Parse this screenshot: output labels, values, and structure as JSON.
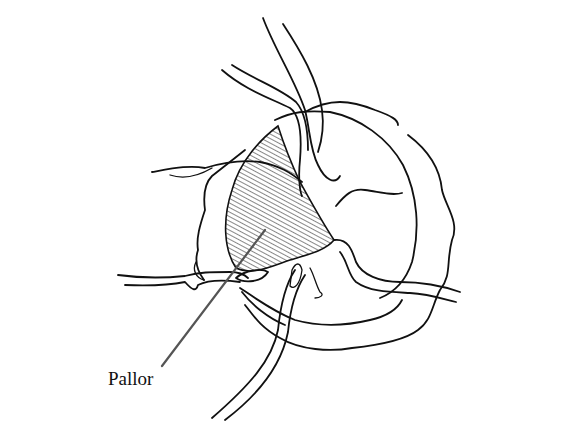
{
  "diagram": {
    "labels": [
      {
        "text": "Pallor",
        "points_to": "hatched region of disc"
      }
    ],
    "colors": {
      "line": "#111111",
      "leader": "#555555",
      "background": "#ffffff"
    }
  }
}
